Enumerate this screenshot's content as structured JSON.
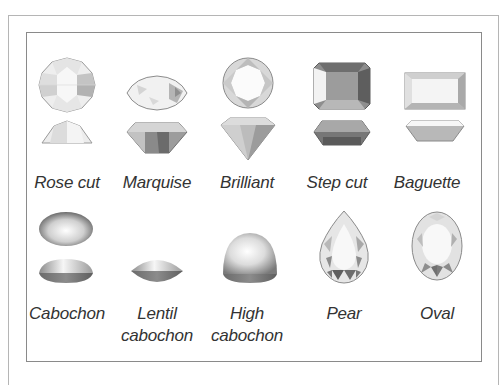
{
  "diagram": {
    "cuts": [
      {
        "id": "rose-cut",
        "label": "Rose cut"
      },
      {
        "id": "marquise",
        "label": "Marquise"
      },
      {
        "id": "brilliant",
        "label": "Brilliant"
      },
      {
        "id": "step-cut",
        "label": "Step cut"
      },
      {
        "id": "baguette",
        "label": "Baguette"
      },
      {
        "id": "cabochon",
        "label": "Cabochon"
      },
      {
        "id": "lentil-cabochon",
        "label_line1": "Lentil",
        "label_line2": "cabochon"
      },
      {
        "id": "high-cabochon",
        "label_line1": "High",
        "label_line2": "cabochon"
      },
      {
        "id": "pear",
        "label": "Pear"
      },
      {
        "id": "oval",
        "label": "Oval"
      }
    ],
    "colors": {
      "frame_outer": "#b5b5b5",
      "frame_inner": "#8a8a8a",
      "label_text": "#333333",
      "gem_light": "#f2f2f2",
      "gem_mid": "#bdbdbd",
      "gem_dark": "#6e6e6e"
    }
  }
}
